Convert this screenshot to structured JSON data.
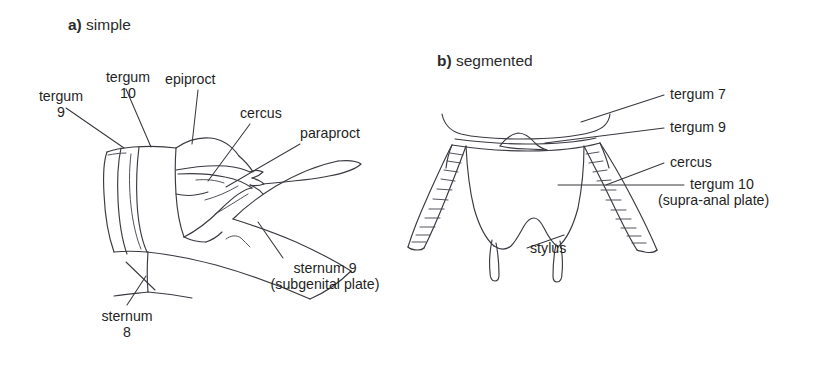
{
  "figure": {
    "background_color": "#ffffff",
    "ink_color": "#3a3a42",
    "text_color": "#1f1f1f"
  },
  "panels": [
    {
      "id": "a",
      "letter": "a)",
      "title": "simple",
      "labels": [
        {
          "key": "tergum9",
          "line1": "tergum",
          "line2": "9"
        },
        {
          "key": "tergum10",
          "line1": "tergum",
          "line2": "10"
        },
        {
          "key": "epiproct",
          "line1": "epiproct",
          "line2": ""
        },
        {
          "key": "cercus",
          "line1": "cercus",
          "line2": ""
        },
        {
          "key": "paraproct",
          "line1": "paraproct",
          "line2": ""
        },
        {
          "key": "sternum9",
          "line1": "sternum 9",
          "line2": "(subgenital plate)"
        },
        {
          "key": "sternum8",
          "line1": "sternum",
          "line2": "8"
        }
      ]
    },
    {
      "id": "b",
      "letter": "b)",
      "title": "segmented",
      "labels": [
        {
          "key": "tergum7",
          "line1": "tergum 7",
          "line2": ""
        },
        {
          "key": "tergum9",
          "line1": "tergum 9",
          "line2": ""
        },
        {
          "key": "cercus",
          "line1": "cercus",
          "line2": ""
        },
        {
          "key": "tergum10",
          "line1": "tergum 10",
          "line2": "(supra-anal plate)"
        },
        {
          "key": "stylus",
          "line1": "stylus",
          "line2": ""
        }
      ]
    }
  ],
  "panel_a": {
    "letter": "a)",
    "title": "simple",
    "tergum9_l1": "tergum",
    "tergum9_l2": "9",
    "tergum10_l1": "tergum",
    "tergum10_l2": "10",
    "epiproct": "epiproct",
    "cercus": "cercus",
    "paraproct": "paraproct",
    "sternum9_l1": "sternum 9",
    "sternum9_l2": "(subgenital plate)",
    "sternum8_l1": "sternum",
    "sternum8_l2": "8"
  },
  "panel_b": {
    "letter": "b)",
    "title": "segmented",
    "tergum7": "tergum 7",
    "tergum9": "tergum 9",
    "cercus": "cercus",
    "tergum10_l1": "tergum 10",
    "tergum10_l2": "(supra-anal plate)",
    "stylus": "stylus"
  }
}
